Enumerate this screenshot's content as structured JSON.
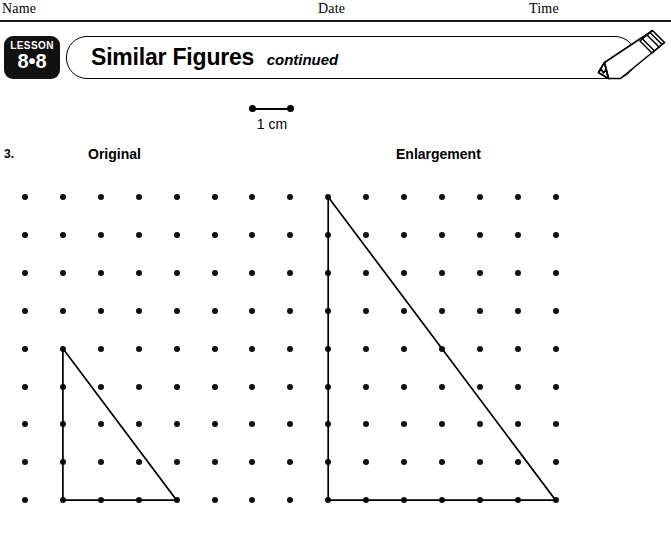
{
  "header": {
    "name_label": "Name",
    "date_label": "Date",
    "time_label": "Time"
  },
  "lesson": {
    "word": "LESSON",
    "number": "8•8"
  },
  "title": {
    "main": "Similar Figures",
    "continued": "continued"
  },
  "icons": {
    "pencil": "pencil-icon"
  },
  "scale": {
    "label": "1 cm",
    "unit_px": 38
  },
  "problem": {
    "number": "3.",
    "original_label": "Original",
    "enlargement_label": "Enlargement"
  },
  "grid": {
    "columns": 15,
    "rows": 9,
    "origin_x": 25,
    "origin_y": 17,
    "spacing": 37.9,
    "dot_color": "#111111"
  },
  "figures": [
    {
      "name": "original-triangle",
      "points_grid": [
        [
          1,
          4
        ],
        [
          1,
          8
        ],
        [
          4,
          8
        ]
      ],
      "width_units": 3,
      "height_units": 4,
      "stroke": "#000000"
    },
    {
      "name": "enlargement-triangle",
      "points_grid": [
        [
          8,
          0
        ],
        [
          8,
          8
        ],
        [
          14,
          8
        ]
      ],
      "width_units": 6,
      "height_units": 8,
      "stroke": "#000000"
    }
  ]
}
